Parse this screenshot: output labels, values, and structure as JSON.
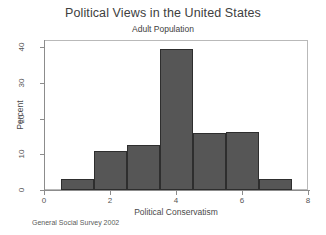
{
  "chart_data": {
    "type": "bar",
    "title": "Political Views in the United States",
    "subtitle": "Adult Population",
    "xlabel": "Political Conservatism",
    "ylabel": "Percent",
    "source_note": "General Social Survey 2002",
    "categories": [
      "1",
      "2",
      "3",
      "4",
      "5",
      "6",
      "7"
    ],
    "bin_edges": [
      0.5,
      1.5,
      2.5,
      3.5,
      4.5,
      5.5,
      6.5,
      7.5
    ],
    "values": [
      3,
      11,
      12.5,
      39.5,
      16,
      16.2,
      3
    ],
    "xlim": [
      0,
      8
    ],
    "ylim": [
      0,
      42
    ],
    "xticks": [
      "0",
      "2",
      "4",
      "6",
      "8"
    ],
    "xtick_values": [
      0,
      2,
      4,
      6,
      8
    ],
    "yticks": [
      "0",
      "10",
      "20",
      "30",
      "40"
    ],
    "ytick_values": [
      0,
      10,
      20,
      30,
      40
    ],
    "grid": false,
    "legend": false,
    "bar_color": "#565656",
    "bar_edge_color": "#2e2e2e",
    "axis_color": "#8c8c8c",
    "background": "#ffffff"
  }
}
